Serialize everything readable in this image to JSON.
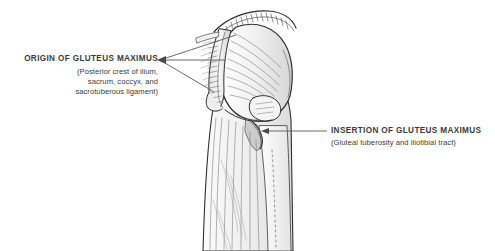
{
  "figure": {
    "background_color": "#ffffff",
    "ink_color": "#3b3b3b",
    "leader_line_color": "#5a5a5a"
  },
  "labels": {
    "origin": {
      "title": "ORIGIN OF GLUTEUS MAXIMUS",
      "subtitle_lines": [
        "(Posterior crest of ilium,",
        "sacrum, coccyx, and",
        "sacrotuberous ligament)"
      ]
    },
    "insertion": {
      "title": "INSERTION OF GLUTEUS MAXIMUS",
      "subtitle_lines": [
        "(Gluteal tuberosity and iliotibial tract)"
      ]
    }
  }
}
